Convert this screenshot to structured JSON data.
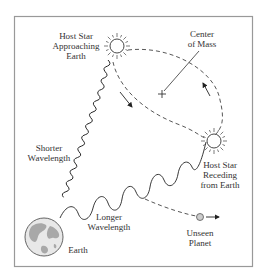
{
  "diagram": {
    "type": "radial-velocity-exoplanet-detection",
    "labels": {
      "host_star_approaching": [
        "Host Star",
        "Approaching",
        "Earth"
      ],
      "center_of_mass": [
        "Center",
        "of Mass"
      ],
      "host_star_receding": [
        "Host Star",
        "Receding",
        "from Earth"
      ],
      "shorter_wavelength": [
        "Shorter",
        "Wavelength"
      ],
      "longer_wavelength": [
        "Longer",
        "Wavelength"
      ],
      "earth": "Earth",
      "unseen_planet": [
        "Unseen",
        "Planet"
      ]
    },
    "icons": {
      "star": "sun-icon",
      "earth": "globe-icon",
      "planet": "planet-icon"
    },
    "colors": {
      "frame": "#999999",
      "line": "#333333",
      "earth_land": "#a8a8a8",
      "earth_ocean": "#e8e8e8",
      "planet_fill": "#cccccc"
    }
  }
}
